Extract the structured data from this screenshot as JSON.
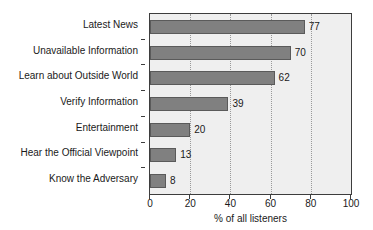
{
  "chart_data": {
    "type": "bar",
    "orientation": "horizontal",
    "title": "",
    "categories": [
      "Latest News",
      "Unavailable Information",
      "Learn about Outside World",
      "Verify Information",
      "Entertainment",
      "Hear the Official Viewpoint",
      "Know the Adversary"
    ],
    "values": [
      77,
      70,
      62,
      39,
      20,
      13,
      8
    ],
    "data_labels": [
      "77",
      "70",
      "62",
      "39",
      "20",
      "13",
      "8"
    ],
    "xlabel": "% of all listeners",
    "ylabel": "",
    "xlim": [
      0,
      100
    ],
    "xticks": [
      0,
      20,
      40,
      60,
      80,
      100
    ],
    "xtick_labels": [
      "0",
      "20",
      "40",
      "60",
      "80",
      "100"
    ],
    "gridlines": {
      "vertical": true,
      "horizontal": false,
      "style": "dotted",
      "at": [
        20,
        40,
        60,
        80
      ]
    },
    "legend": null,
    "colors": {
      "bar_fill": "#808080",
      "bar_edge": "#5a5a5a",
      "plot_background": "#efefef",
      "axis": "#3d3d3d",
      "grid": "#9a9a9a",
      "text": "#1a1a1a",
      "page_background": "#ffffff"
    }
  }
}
